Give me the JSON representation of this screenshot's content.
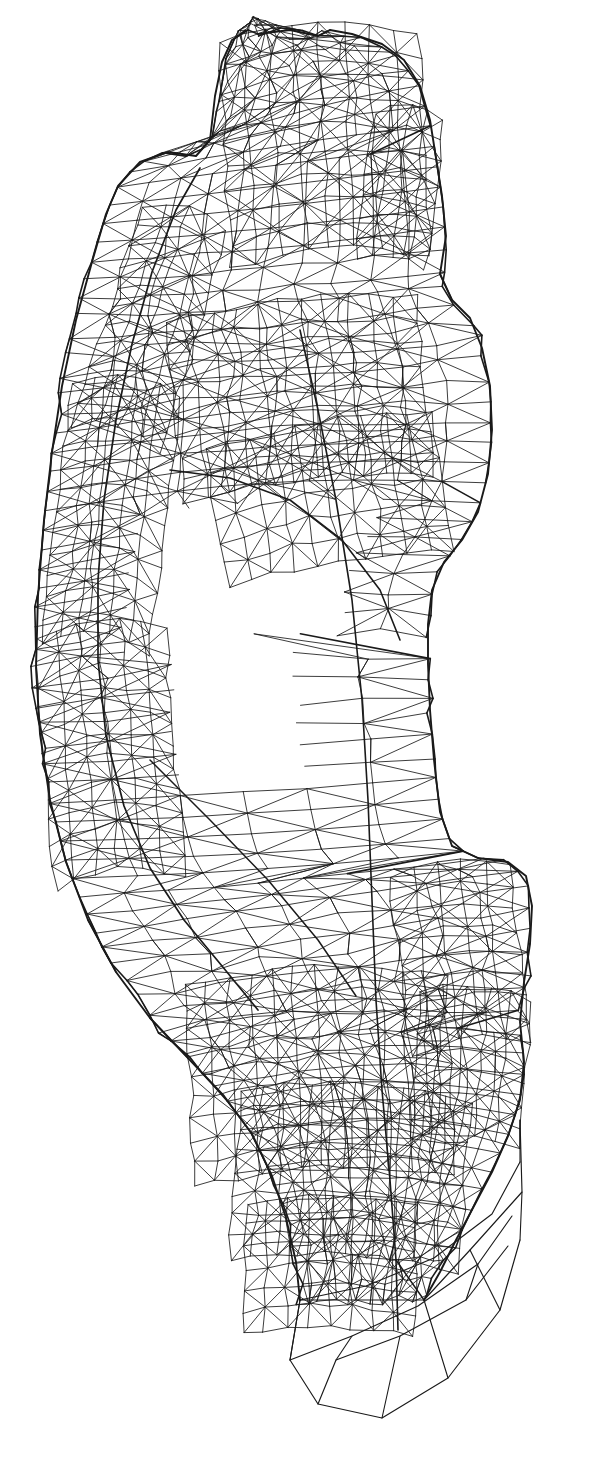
{
  "meta": {
    "domain": "Diagram",
    "width": 603,
    "height": 1463
  },
  "canvas": {
    "background_color": "#ffffff",
    "line_color": "#1a1a1a",
    "line_width": 0.85,
    "heavy_line_width": 1.6
  },
  "caption": {
    "text": "",
    "visible": false,
    "note": "faint partially cropped text at bottom-left edge"
  },
  "figure": {
    "name": "reclining-figure-wireframe",
    "render_style": "wireframe-triangulation",
    "shading": "none",
    "fill": "none"
  },
  "chart_data": {
    "type": "scatter",
    "xlabel": "",
    "ylabel": "",
    "grid": false,
    "legend": null,
    "xlim": [
      0,
      603
    ],
    "ylim": [
      0,
      1463
    ],
    "regions": [
      {
        "name": "head-and-upper-block",
        "x": 215,
        "y": 28,
        "w": 230,
        "h": 265,
        "density": "medium"
      },
      {
        "name": "left-arm-outer-sweep",
        "x": 30,
        "y": 155,
        "w": 200,
        "h": 800,
        "density": "medium"
      },
      {
        "name": "torso-and-shoulder",
        "x": 150,
        "y": 290,
        "w": 320,
        "h": 330,
        "density": "high"
      },
      {
        "name": "interior-void-upper",
        "x": 150,
        "y": 590,
        "w": 230,
        "h": 180,
        "density": "none"
      },
      {
        "name": "mid-body-panels",
        "x": 170,
        "y": 620,
        "w": 330,
        "h": 380,
        "density": "medium"
      },
      {
        "name": "lower-body-knot",
        "x": 210,
        "y": 1000,
        "w": 320,
        "h": 300,
        "density": "high"
      },
      {
        "name": "base-pedestal",
        "x": 280,
        "y": 1230,
        "w": 250,
        "h": 220,
        "density": "low"
      }
    ]
  }
}
